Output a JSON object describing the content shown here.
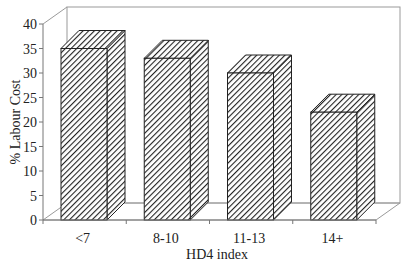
{
  "chart_data": {
    "type": "bar",
    "style": "3d-column",
    "title": "",
    "categories": [
      "<7",
      "8-10",
      "11-13",
      "14+"
    ],
    "values": [
      35,
      33,
      30,
      22
    ],
    "xlabel": "HD4 index",
    "ylabel": "% Labour Cost",
    "ylim": [
      0,
      40
    ],
    "yticks": [
      0,
      5,
      10,
      15,
      20,
      25,
      30,
      35,
      40
    ],
    "grid": false,
    "legend": null,
    "fill_pattern": "diagonal-hatch",
    "colors": {
      "bar_stroke": "#222222",
      "hatch": "#222222",
      "frame": "#9a9a9a",
      "axis": "#777777"
    }
  }
}
